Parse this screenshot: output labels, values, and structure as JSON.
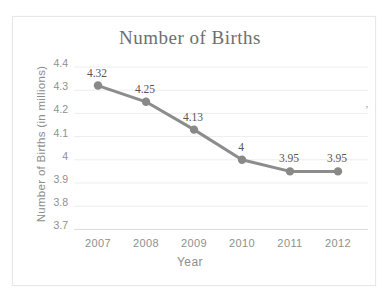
{
  "chart_data": {
    "type": "line",
    "title": "Number of Births",
    "xlabel": "Year",
    "ylabel": "Number of Births (in millions)",
    "categories": [
      "2007",
      "2008",
      "2009",
      "2010",
      "2011",
      "2012"
    ],
    "series": [
      {
        "name": "Number of Births",
        "values": [
          4.32,
          4.25,
          4.13,
          4.0,
          3.95,
          3.95
        ],
        "point_labels": [
          "4.32",
          "4.25",
          "4.13",
          "4",
          "3.95",
          "3.95"
        ]
      }
    ],
    "y_ticks": [
      "4.4",
      "4.3",
      "4.2",
      "4.1",
      "4",
      "3.9",
      "3.8",
      "3.7"
    ],
    "ylim": [
      3.7,
      4.4
    ],
    "grid": "horizontal",
    "legend": "none",
    "colors": {
      "line": "#8c8c8c",
      "marker": "#898989",
      "point_label": "#555555",
      "tick_label": "#8f8f8f",
      "title": "#6e6e6e",
      "gridline": "#ededed",
      "bottom_axis": "#dcdcdc"
    }
  },
  "artifact_mark": "’"
}
